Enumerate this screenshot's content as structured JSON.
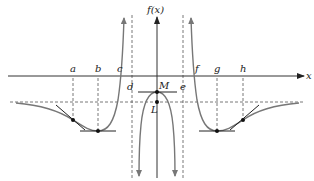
{
  "diagram": {
    "type": "function-graph",
    "y_axis_label": "f(x)",
    "x_axis_label": "x",
    "x_points": [
      "a",
      "b",
      "c",
      "d",
      "e",
      "f",
      "g",
      "h"
    ],
    "point_labels": {
      "a": "a",
      "b": "b",
      "c": "c",
      "d": "d",
      "e": "e",
      "f": "f",
      "g": "g",
      "h": "h",
      "M": "M",
      "L": "L"
    },
    "features": {
      "vertical_asymptotes": [
        "d",
        "e"
      ],
      "horizontal_asymptote": "L",
      "local_minima": [
        "b",
        "g"
      ],
      "local_maximum": "M",
      "inflection_points": [
        "a",
        "h"
      ],
      "x_intercepts": [
        "c",
        "f"
      ]
    },
    "colors": {
      "curve": "#777777",
      "axis": "#333333",
      "points": "#111111"
    }
  }
}
